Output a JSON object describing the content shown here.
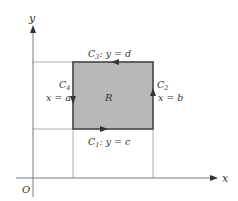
{
  "diagram": {
    "axes": {
      "x_label": "x",
      "y_label": "y",
      "origin_label": "O"
    },
    "region": {
      "label": "R",
      "fill": "#b8b8b8",
      "edge_color": "#444444"
    },
    "curves": {
      "c1": {
        "name": "C",
        "sub": "1",
        "eq": ": y = c"
      },
      "c2": {
        "name": "C",
        "sub": "2",
        "eq": "x = b"
      },
      "c3": {
        "name": "C",
        "sub": "3",
        "eq": ": y = d"
      },
      "c4": {
        "name": "C",
        "sub": "4",
        "eq": "x = a"
      }
    },
    "guide_color": "#8a8a8a",
    "axis_color": "#7a7a7a"
  }
}
